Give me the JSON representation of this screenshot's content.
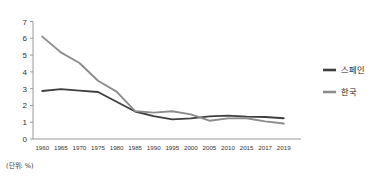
{
  "chart_data": {
    "type": "line",
    "title": "",
    "subtitle": "",
    "xlabel": "",
    "ylabel": "",
    "unit_note": "(단위: %)",
    "grid": false,
    "legend_position": "right",
    "categories": [
      "1960",
      "1965",
      "1970",
      "1975",
      "1980",
      "1985",
      "1990",
      "1995",
      "2000",
      "2005",
      "2010",
      "2015",
      "2017",
      "2019"
    ],
    "x": [
      1960,
      1965,
      1970,
      1975,
      1980,
      1985,
      1990,
      1995,
      2000,
      2005,
      2010,
      2015,
      2017,
      2019
    ],
    "ylim": [
      0,
      7
    ],
    "yticks": [
      0,
      1,
      2,
      3,
      4,
      5,
      6,
      7
    ],
    "ytick_labels": [
      "0",
      "1",
      "2",
      "3",
      "4",
      "5",
      "6",
      "7"
    ],
    "series": [
      {
        "name": "스페인",
        "color": "#3f3f3f",
        "values": [
          2.86,
          2.97,
          2.88,
          2.8,
          2.22,
          1.64,
          1.36,
          1.17,
          1.23,
          1.35,
          1.39,
          1.33,
          1.31,
          1.24
        ]
      },
      {
        "name": "한국",
        "color": "#8c8c8c",
        "values": [
          6.1,
          5.16,
          4.53,
          3.47,
          2.82,
          1.66,
          1.57,
          1.65,
          1.47,
          1.09,
          1.23,
          1.24,
          1.05,
          0.92
        ]
      }
    ]
  },
  "legend": {
    "items": [
      {
        "label": "스페인",
        "color": "#3f3f3f"
      },
      {
        "label": "한국",
        "color": "#8c8c8c"
      }
    ]
  },
  "axis": {
    "y_labels": [
      "7",
      "6",
      "5",
      "4",
      "3",
      "2",
      "1",
      "0"
    ],
    "x_labels": [
      "1960",
      "1965",
      "1970",
      "1975",
      "1980",
      "1985",
      "1990",
      "1995",
      "2000",
      "2005",
      "2010",
      "2015",
      "2017",
      "2019"
    ]
  },
  "footnote": {
    "text": "(단위: %)"
  }
}
